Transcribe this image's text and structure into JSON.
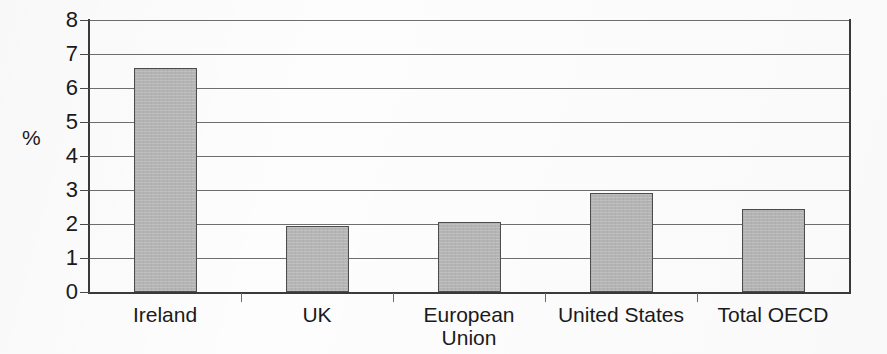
{
  "chart_data": {
    "type": "bar",
    "title": "",
    "subtitle": "",
    "xlabel": "",
    "ylabel": "%",
    "categories": [
      "Ireland",
      "UK",
      "European\nUnion",
      "United States",
      "Total OECD"
    ],
    "values": [
      6.6,
      1.95,
      2.05,
      2.9,
      2.45
    ],
    "ylim": [
      0,
      8
    ],
    "ytick_labels": [
      "0",
      "1",
      "2",
      "3",
      "4",
      "5",
      "6",
      "7",
      "8"
    ],
    "ytick_values": [
      0,
      1,
      2,
      3,
      4,
      5,
      6,
      7,
      8
    ],
    "grid": true,
    "grid_axis": "y",
    "legend": false,
    "legend_position": "none",
    "bar_fill_color": "#b5b5b5",
    "bar_edge_color": "#4d4d4d",
    "axis_color": "#3a3a3a",
    "gridline_color": "#6e6e6e",
    "background_color": "#fdfdfd",
    "annotations": []
  }
}
